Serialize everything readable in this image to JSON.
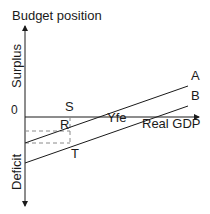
{
  "diagram": {
    "y_axis_title": "Budget position",
    "x_axis_title": "Real GDP",
    "upper_region_label": "Surplus",
    "lower_region_label": "Deficit",
    "origin_label": "0",
    "lines": [
      {
        "label": "A"
      },
      {
        "label": "B"
      }
    ],
    "points": {
      "S": "S",
      "R": "R",
      "T": "T",
      "Yfe": "Yfe"
    },
    "colors": {
      "line": "#1a1a1a",
      "dashed": "#8a8a8a",
      "background": "#ffffff"
    }
  }
}
